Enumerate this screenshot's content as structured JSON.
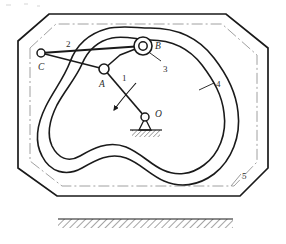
{
  "figure": {
    "type": "mechanism-diagram",
    "background_color": "#ffffff",
    "line_color": "#1a1a1a",
    "centerline_color": "#9a9a9a"
  },
  "labels": [
    {
      "id": "label-1",
      "text": "1",
      "x": 122,
      "y": 74,
      "italic": false,
      "meaning": "crank link OA"
    },
    {
      "id": "label-2",
      "text": "2",
      "x": 66,
      "y": 40,
      "italic": false,
      "meaning": "link C-A"
    },
    {
      "id": "label-3",
      "text": "3",
      "x": 163,
      "y": 65,
      "italic": false,
      "meaning": "roller at B"
    },
    {
      "id": "label-4",
      "text": "4",
      "x": 216,
      "y": 80,
      "italic": false,
      "meaning": "grooved cam plate"
    },
    {
      "id": "label-5",
      "text": "5",
      "x": 242,
      "y": 172,
      "italic": false,
      "meaning": "frame centerline"
    },
    {
      "id": "label-A",
      "text": "A",
      "x": 99,
      "y": 80,
      "italic": true,
      "meaning": "joint A"
    },
    {
      "id": "label-B",
      "text": "B",
      "x": 155,
      "y": 42,
      "italic": true,
      "meaning": "roller centre B"
    },
    {
      "id": "label-C",
      "text": "C",
      "x": 38,
      "y": 63,
      "italic": true,
      "meaning": "fixed pivot C"
    },
    {
      "id": "label-O",
      "text": "O",
      "x": 155,
      "y": 110,
      "italic": true,
      "meaning": "cam rotation centre O"
    }
  ],
  "joints": [
    {
      "name": "joint-c",
      "x": 41,
      "y": 53,
      "r": 4.0,
      "type": "pin"
    },
    {
      "name": "joint-a",
      "x": 104,
      "y": 69,
      "r": 5.0,
      "type": "pin"
    },
    {
      "name": "joint-b-roller-outer",
      "x": 143,
      "y": 46,
      "r": 9.0,
      "type": "roller"
    },
    {
      "name": "joint-b-roller-inner",
      "x": 143,
      "y": 46,
      "r": 4.2,
      "type": "pin"
    },
    {
      "name": "pivot-o",
      "x": 145,
      "y": 117,
      "r": 4.0,
      "type": "ground-pivot"
    }
  ],
  "links": [
    {
      "name": "link-c-to-b",
      "from": [
        41,
        53
      ],
      "to": [
        143,
        46
      ]
    },
    {
      "name": "link-c-to-a",
      "from": [
        41,
        53
      ],
      "to": [
        104,
        69
      ]
    },
    {
      "name": "link-a-to-b",
      "from": [
        104,
        69
      ],
      "to": [
        143,
        46
      ]
    },
    {
      "name": "link-a-to-o",
      "from": [
        104,
        69
      ],
      "to": [
        145,
        117
      ]
    }
  ],
  "frame": {
    "name": "octagonal-frame",
    "points": "18,41 49,14 226,14 268,48 268,168 240,196 57,196 18,168",
    "ground_hatch": {
      "x": 58,
      "y": 219,
      "width": 175,
      "height": 9
    }
  },
  "centerline": {
    "name": "frame-centerline-5",
    "points": "30,48 56,24 222,24 257,55 257,162 234,186 62,186 30,161",
    "rx": 14
  },
  "cam": {
    "name": "cam-groove",
    "outer_path": "M 150,28 C 182,28 202,42 214,58 C 228,76 236,92 238,112 C 241,136 232,160 214,174 C 198,186 180,188 164,181 C 150,175 140,163 126,158 C 110,152 96,160 82,168 C 66,177 50,172 42,156 C 34,141 38,122 46,106 C 54,90 64,78 70,62 C 76,46 88,34 106,29 C 120,25 136,28 150,28 Z",
    "inner_path": "M 150,40 C 176,40 192,52 202,65 C 214,81 222,95 224,113 C 227,134 219,154 204,165 C 191,175 176,176 163,170 C 151,165 141,153 126,147 C 108,140 92,149 80,156 C 68,163 58,158 52,146 C 46,133 50,119 57,105 C 65,90 76,78 82,64 C 88,50 98,41 112,38 C 125,35 138,40 150,40 Z"
  },
  "rotation_arrow": {
    "name": "rotation-direction-arrow",
    "path": "M 135,84 C 128,92 120,100 113,110",
    "arrow_tip": [
      112,
      112
    ]
  },
  "leaders": [
    {
      "name": "leader-3",
      "from": [
        161,
        62
      ],
      "to": [
        150,
        54
      ]
    },
    {
      "name": "leader-4",
      "from": [
        215,
        84
      ],
      "to": [
        200,
        90
      ]
    },
    {
      "name": "leader-5",
      "from": [
        241,
        175
      ],
      "to": [
        232,
        186
      ]
    }
  ]
}
